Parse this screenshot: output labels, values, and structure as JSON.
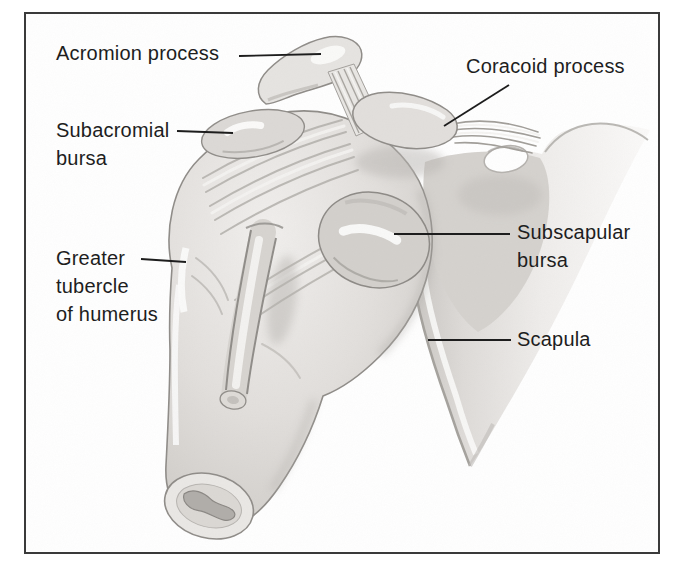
{
  "labels": {
    "acromion_process": "Acromion process",
    "subacromial_bursa": [
      "Subacromial",
      "bursa"
    ],
    "greater_tubercle": [
      "Greater",
      "tubercle",
      "of humerus"
    ],
    "coracoid_process": "Coracoid process",
    "subscapular_bursa": [
      "Subscapular",
      "bursa"
    ],
    "scapula": "Scapula"
  },
  "colors": {
    "background": "#ffffff",
    "frame_border": "#3a3a3a",
    "label_text": "#1e1e1e",
    "leader_line": "#1d1d1d",
    "bone_highlight": "#fbfbfa",
    "bone_light": "#eceae8",
    "bone_mid": "#d6d3cf",
    "bone_shadow": "#b5b2ae",
    "outline": "#8f8c88"
  }
}
